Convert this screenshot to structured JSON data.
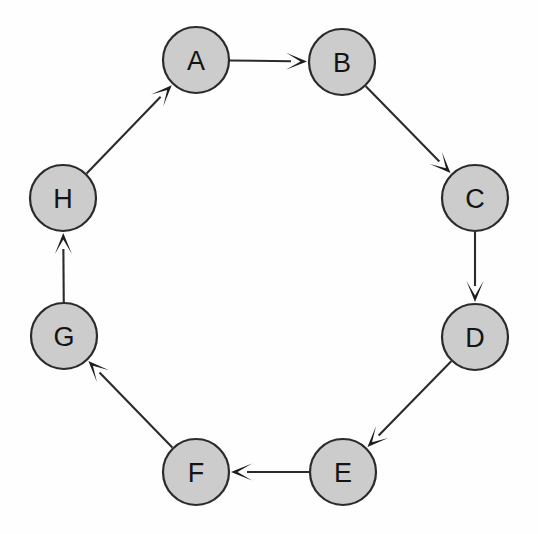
{
  "diagram": {
    "type": "directed-graph",
    "layout": "circular",
    "background_color": "#ffffff",
    "node_fill_color": "#cccccc",
    "node_stroke_color": "#2b2b2b",
    "edge_color": "#2b2b2b",
    "label_color": "#141414",
    "node_radius": 33,
    "center": {
      "x": 269,
      "y": 266
    },
    "nodes": [
      {
        "id": "A",
        "label": "A",
        "x": 196,
        "y": 60
      },
      {
        "id": "B",
        "label": "B",
        "x": 342,
        "y": 62
      },
      {
        "id": "C",
        "label": "C",
        "x": 475,
        "y": 198
      },
      {
        "id": "D",
        "label": "D",
        "x": 475,
        "y": 337
      },
      {
        "id": "E",
        "label": "E",
        "x": 343,
        "y": 472
      },
      {
        "id": "F",
        "label": "F",
        "x": 196,
        "y": 472
      },
      {
        "id": "G",
        "label": "G",
        "x": 64,
        "y": 336
      },
      {
        "id": "H",
        "label": "H",
        "x": 63,
        "y": 198
      }
    ],
    "edges": [
      {
        "from": "A",
        "to": "B",
        "directed": true,
        "label": "A to B"
      },
      {
        "from": "B",
        "to": "C",
        "directed": true,
        "label": "B to C"
      },
      {
        "from": "C",
        "to": "D",
        "directed": true,
        "label": "C to D"
      },
      {
        "from": "D",
        "to": "E",
        "directed": true,
        "label": "D to E"
      },
      {
        "from": "E",
        "to": "F",
        "directed": true,
        "label": "E to F"
      },
      {
        "from": "F",
        "to": "G",
        "directed": true,
        "label": "F to G"
      },
      {
        "from": "G",
        "to": "H",
        "directed": true,
        "label": "G to H"
      },
      {
        "from": "H",
        "to": "A",
        "directed": true,
        "label": "H to A"
      }
    ]
  }
}
